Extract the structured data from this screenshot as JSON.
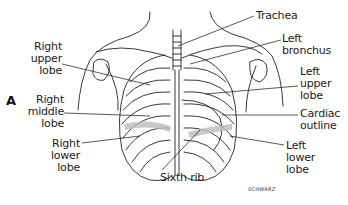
{
  "figure": {
    "panel_label": "A",
    "signature": "SCHWARZ",
    "labels": {
      "trachea": "Trachea",
      "left_bronchus": [
        "Left",
        "bronchus"
      ],
      "right_upper_lobe": [
        "Right",
        "upper",
        "lobe"
      ],
      "left_upper_lobe": [
        "Left",
        "upper",
        "lobe"
      ],
      "right_middle_lobe": [
        "Right",
        "middle",
        "lobe"
      ],
      "cardiac_outline": [
        "Cardiac",
        "outline"
      ],
      "right_lower_lobe": [
        "Right",
        "lower",
        "lobe"
      ],
      "sixth_rib": "Sixth rib",
      "left_lower_lobe": [
        "Left",
        "lower",
        "lobe"
      ]
    }
  }
}
